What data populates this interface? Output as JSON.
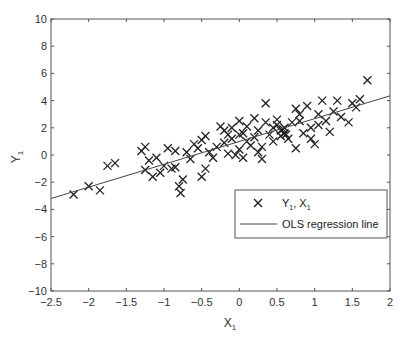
{
  "chart_data": {
    "type": "scatter",
    "title": "",
    "xlabel": "X",
    "xlabel_sub": "1",
    "ylabel": "Y",
    "ylabel_sub": "1",
    "xlim": [
      -2.5,
      2
    ],
    "ylim": [
      -10,
      10
    ],
    "xticks": [
      -2.5,
      -2,
      -1.5,
      -1,
      -0.5,
      0,
      0.5,
      1,
      1.5,
      2
    ],
    "xtick_labels": [
      "−2.5",
      "−2",
      "−1.5",
      "−1",
      "−0.5",
      "0",
      "0.5",
      "1",
      "1.5",
      "2"
    ],
    "yticks": [
      -10,
      -8,
      -6,
      -4,
      -2,
      0,
      2,
      4,
      6,
      8,
      10
    ],
    "ytick_labels": [
      "−10",
      "−8",
      "−6",
      "−4",
      "−2",
      "0",
      "2",
      "4",
      "6",
      "8",
      "10"
    ],
    "grid": false,
    "legend_position": "lower right (inside)",
    "series": [
      {
        "name": "Y1, X1",
        "marker": "x",
        "points": [
          [
            -2.2,
            -2.9
          ],
          [
            -2.0,
            -2.3
          ],
          [
            -1.85,
            -2.6
          ],
          [
            -1.75,
            -0.8
          ],
          [
            -1.65,
            -0.6
          ],
          [
            -1.3,
            0.3
          ],
          [
            -1.25,
            0.6
          ],
          [
            -1.25,
            -1.1
          ],
          [
            -1.2,
            -0.4
          ],
          [
            -1.15,
            -1.6
          ],
          [
            -1.1,
            -0.2
          ],
          [
            -1.05,
            -1.3
          ],
          [
            -1.0,
            -0.8
          ],
          [
            -0.95,
            0.5
          ],
          [
            -0.9,
            -1.0
          ],
          [
            -0.85,
            0.3
          ],
          [
            -0.85,
            -0.9
          ],
          [
            -0.8,
            -2.3
          ],
          [
            -0.78,
            -2.8
          ],
          [
            -0.75,
            -1.8
          ],
          [
            -0.7,
            0.2
          ],
          [
            -0.65,
            -0.3
          ],
          [
            -0.55,
            0.5
          ],
          [
            -0.5,
            1.1
          ],
          [
            -0.5,
            -1.6
          ],
          [
            -0.45,
            1.4
          ],
          [
            -0.45,
            -1.0
          ],
          [
            -0.4,
            0.2
          ],
          [
            -0.35,
            -0.2
          ],
          [
            -0.3,
            0.6
          ],
          [
            -0.25,
            2.1
          ],
          [
            -0.2,
            1.8
          ],
          [
            -0.2,
            0.9
          ],
          [
            -0.15,
            1.5
          ],
          [
            -0.15,
            0.1
          ],
          [
            -0.1,
            2.0
          ],
          [
            -0.1,
            1.2
          ],
          [
            -0.05,
            0.0
          ],
          [
            0.0,
            2.5
          ],
          [
            0.0,
            1.5
          ],
          [
            0.0,
            0.4
          ],
          [
            0.05,
            1.6
          ],
          [
            0.05,
            -0.2
          ],
          [
            0.1,
            2.1
          ],
          [
            0.1,
            1.0
          ],
          [
            0.15,
            0.7
          ],
          [
            0.2,
            2.7
          ],
          [
            0.2,
            1.3
          ],
          [
            0.25,
            0.2
          ],
          [
            0.25,
            1.8
          ],
          [
            0.3,
            0.6
          ],
          [
            0.3,
            -0.3
          ],
          [
            0.35,
            2.4
          ],
          [
            0.35,
            3.8
          ],
          [
            0.4,
            1.5
          ],
          [
            0.45,
            1.0
          ],
          [
            0.5,
            2.2
          ],
          [
            0.5,
            2.6
          ],
          [
            0.55,
            1.8
          ],
          [
            0.55,
            1.4
          ],
          [
            0.6,
            2.0
          ],
          [
            0.6,
            1.6
          ],
          [
            0.65,
            1.2
          ],
          [
            0.7,
            2.4
          ],
          [
            0.75,
            0.5
          ],
          [
            0.75,
            3.4
          ],
          [
            0.8,
            2.5
          ],
          [
            0.8,
            3.0
          ],
          [
            0.85,
            1.6
          ],
          [
            0.9,
            3.6
          ],
          [
            0.95,
            2.0
          ],
          [
            0.95,
            1.2
          ],
          [
            1.0,
            0.8
          ],
          [
            1.05,
            3.0
          ],
          [
            1.05,
            2.2
          ],
          [
            1.1,
            4.0
          ],
          [
            1.15,
            2.5
          ],
          [
            1.2,
            1.7
          ],
          [
            1.25,
            3.2
          ],
          [
            1.3,
            4.0
          ],
          [
            1.35,
            2.8
          ],
          [
            1.45,
            2.4
          ],
          [
            1.5,
            3.8
          ],
          [
            1.55,
            3.5
          ],
          [
            1.6,
            4.1
          ],
          [
            1.7,
            5.5
          ],
          [
            -0.6,
            0.8
          ],
          [
            0.45,
            2.0
          ],
          [
            0.58,
            1.9
          ],
          [
            0.62,
            1.5
          ]
        ]
      },
      {
        "name": "OLS regression line",
        "type": "line",
        "x": [
          -2.5,
          2
        ],
        "y": [
          -3.2,
          4.35
        ]
      }
    ]
  },
  "legend": {
    "entries": [
      {
        "label_main": "Y",
        "label_sub1": "1",
        "label_mid": ", X",
        "label_sub2": "1",
        "symbol": "x-marker"
      },
      {
        "label": "OLS regression line",
        "symbol": "line"
      }
    ]
  },
  "colors": {
    "axis": "#555555",
    "marker": "#222222",
    "line": "#444444",
    "legend_border": "#555555"
  }
}
